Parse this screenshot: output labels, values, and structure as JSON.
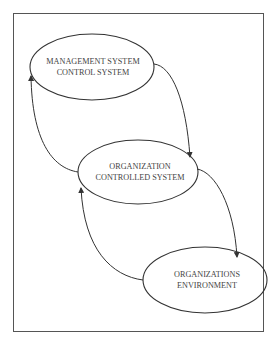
{
  "diagram": {
    "type": "cycle-flow",
    "nodes": [
      {
        "id": "management",
        "line1": "MANAGEMENT SYSTEM",
        "line2": "CONTROL SYSTEM",
        "cx": 92,
        "cy": 67,
        "rx": 62,
        "ry": 33
      },
      {
        "id": "organization",
        "line1": "ORGANIZATION",
        "line2": "CONTROLLED SYSTEM",
        "cx": 138,
        "cy": 172,
        "rx": 60,
        "ry": 32
      },
      {
        "id": "environment",
        "line1": "ORGANIZATIONS",
        "line2": "ENVIRONMENT",
        "cx": 205,
        "cy": 280,
        "rx": 62,
        "ry": 33
      }
    ],
    "edges": [
      {
        "from": "management",
        "to": "organization"
      },
      {
        "from": "organization",
        "to": "management"
      },
      {
        "from": "organization",
        "to": "environment"
      },
      {
        "from": "environment",
        "to": "organization"
      }
    ],
    "colors": {
      "stroke": "#333333",
      "text": "#444444",
      "frame": "#555555",
      "background": "#ffffff"
    }
  }
}
